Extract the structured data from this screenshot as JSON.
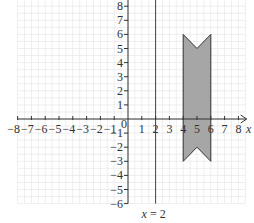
{
  "chart_data": {
    "type": "diagram-plot",
    "title": "",
    "xlabel": "x",
    "ylabel": "",
    "xlim": [
      -8,
      8.5
    ],
    "ylim": [
      -6,
      8.3
    ],
    "grid": true,
    "x_ticks": [
      -8,
      -7,
      -6,
      -5,
      -4,
      -3,
      -2,
      -1,
      1,
      2,
      3,
      4,
      5,
      6,
      7,
      8
    ],
    "x_tick_labels": [
      "−8",
      "−7",
      "−6",
      "−5",
      "−4",
      "−3",
      "−2",
      "−1",
      "1",
      "2",
      "3",
      "4",
      "5",
      "6",
      "7",
      "8"
    ],
    "y_ticks": [
      8,
      7,
      6,
      5,
      4,
      3,
      2,
      1,
      -1,
      -2,
      -3,
      -4,
      -5,
      -6
    ],
    "y_tick_labels": [
      "8",
      "7",
      "6",
      "5",
      "4",
      "3",
      "2",
      "1",
      "−1",
      "−2",
      "−3",
      "−4",
      "−5",
      "−6"
    ],
    "origin_label": "0",
    "lines": [
      {
        "name": "x = 2",
        "type": "vertical",
        "x": 2,
        "label": "x = 2"
      }
    ],
    "shapes": [
      {
        "name": "shaded polygon",
        "fill": "#a6a6a6",
        "stroke": "#333333",
        "vertices": [
          [
            4,
            6
          ],
          [
            5,
            5
          ],
          [
            6,
            6
          ],
          [
            6,
            -3
          ],
          [
            5,
            -2
          ],
          [
            4,
            -3
          ]
        ]
      }
    ]
  },
  "labels": {
    "x_axis_var": "x",
    "line_label": "x = 2",
    "origin": "0"
  },
  "colors": {
    "grid": "#e2e2e2",
    "axis": "#333333",
    "shape_fill": "#a6a6a6",
    "line": "#444444"
  }
}
